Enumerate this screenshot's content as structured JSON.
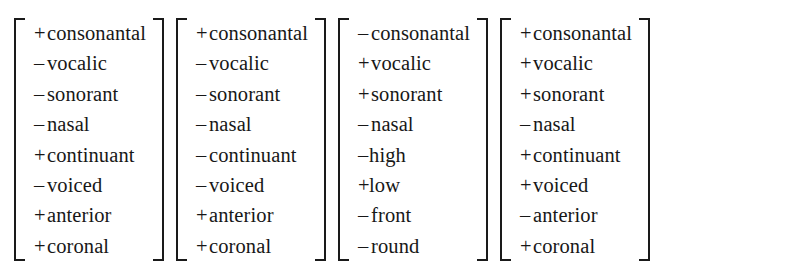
{
  "figure": {
    "name": "phonological-feature-matrices",
    "background_color": "#ffffff",
    "text_color": "#171717",
    "bracket_color": "#1a1a1a"
  },
  "matrices": [
    {
      "index": 1,
      "label": "feature-matrix-1",
      "rows": [
        {
          "sign": "+",
          "feature": "consonantal",
          "tight": false
        },
        {
          "sign": "–",
          "feature": "vocalic",
          "tight": false
        },
        {
          "sign": "–",
          "feature": "sonorant",
          "tight": false
        },
        {
          "sign": "–",
          "feature": "nasal",
          "tight": false
        },
        {
          "sign": "+",
          "feature": "continuant",
          "tight": false
        },
        {
          "sign": "–",
          "feature": "voiced",
          "tight": false
        },
        {
          "sign": "+",
          "feature": "anterior",
          "tight": false
        },
        {
          "sign": "+",
          "feature": "coronal",
          "tight": false
        }
      ]
    },
    {
      "index": 2,
      "label": "feature-matrix-2",
      "rows": [
        {
          "sign": "+",
          "feature": "consonantal",
          "tight": false
        },
        {
          "sign": "–",
          "feature": "vocalic",
          "tight": false
        },
        {
          "sign": "–",
          "feature": "sonorant",
          "tight": false
        },
        {
          "sign": "–",
          "feature": "nasal",
          "tight": false
        },
        {
          "sign": "–",
          "feature": "continuant",
          "tight": false
        },
        {
          "sign": "–",
          "feature": "voiced",
          "tight": false
        },
        {
          "sign": "+",
          "feature": "anterior",
          "tight": false
        },
        {
          "sign": "+",
          "feature": "coronal",
          "tight": false
        }
      ]
    },
    {
      "index": 3,
      "label": "feature-matrix-3",
      "rows": [
        {
          "sign": "–",
          "feature": "consonantal",
          "tight": false
        },
        {
          "sign": "+",
          "feature": "vocalic",
          "tight": false
        },
        {
          "sign": "+",
          "feature": "sonorant",
          "tight": false
        },
        {
          "sign": "–",
          "feature": "nasal",
          "tight": false
        },
        {
          "sign": "–",
          "feature": "high",
          "tight": true
        },
        {
          "sign": "+",
          "feature": "low",
          "tight": true
        },
        {
          "sign": "–",
          "feature": "front",
          "tight": false
        },
        {
          "sign": "–",
          "feature": "round",
          "tight": false
        }
      ]
    },
    {
      "index": 4,
      "label": "feature-matrix-4",
      "rows": [
        {
          "sign": "+",
          "feature": "consonantal",
          "tight": false
        },
        {
          "sign": "+",
          "feature": "vocalic",
          "tight": false
        },
        {
          "sign": "+",
          "feature": "sonorant",
          "tight": false
        },
        {
          "sign": "–",
          "feature": "nasal",
          "tight": false
        },
        {
          "sign": "+",
          "feature": "continuant",
          "tight": false
        },
        {
          "sign": "+",
          "feature": "voiced",
          "tight": false
        },
        {
          "sign": "–",
          "feature": "anterior",
          "tight": false
        },
        {
          "sign": "+",
          "feature": "coronal",
          "tight": false
        }
      ]
    }
  ]
}
